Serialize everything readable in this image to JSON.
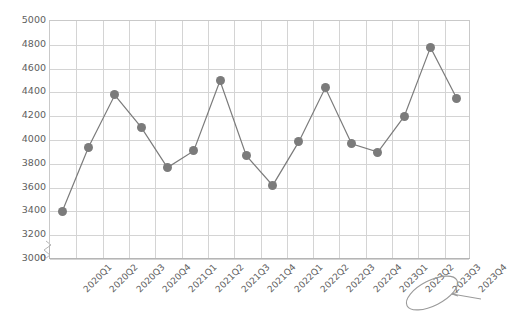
{
  "chart_data": {
    "type": "line",
    "title": "",
    "subtitle": "",
    "xlabel": "",
    "ylabel": "",
    "ylim": [
      3000,
      5000
    ],
    "y_axis_broken": true,
    "y_break_base_label": "0",
    "yticks": [
      3000,
      3200,
      3400,
      3600,
      3800,
      4000,
      4200,
      4400,
      4600,
      4800,
      5000
    ],
    "ytick_labels": [
      "3000",
      "3200",
      "3400",
      "3600",
      "3800",
      "4000",
      "4200",
      "4400",
      "4600",
      "4800",
      "5000"
    ],
    "grid": true,
    "legend": "none",
    "categories": [
      "2020Q1",
      "2020Q2",
      "2020Q3",
      "2020Q4",
      "2021Q1",
      "2021Q2",
      "2021Q3",
      "2021Q4",
      "2022Q1",
      "2022Q2",
      "2022Q3",
      "2022Q4",
      "2023Q1",
      "2023Q2",
      "2023Q3",
      "2023Q4"
    ],
    "series": [
      {
        "name": "Value",
        "color": "#7b7b7b",
        "marker": "circle",
        "values": [
          3390,
          3930,
          4370,
          4100,
          3760,
          3900,
          4490,
          3860,
          3610,
          3980,
          4430,
          3960,
          3890,
          4190,
          4770,
          4340
        ]
      }
    ]
  },
  "annotations": {
    "circled_label": "2023Q4",
    "circle_shape": "hand-drawn-ellipse",
    "arrow": "hand-drawn-arrow-pointing-left",
    "ink_color": "#9a9a9a"
  },
  "style": {
    "line_color": "#7b7b7b",
    "marker_color": "#7b7b7b",
    "grid_color": "#d4d4d4",
    "axis_color": "#b5b5b5",
    "text_color": "#5e5e5e",
    "background": "#ffffff"
  }
}
